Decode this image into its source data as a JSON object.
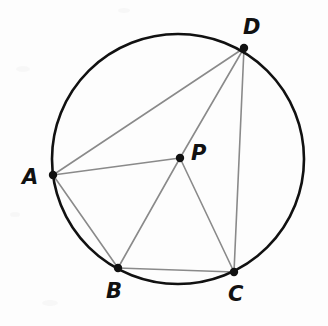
{
  "figure": {
    "background_color": "#fdfdfd",
    "circle_color": "#111111",
    "chord_color": "#8a8a8a",
    "point_color": "#111111",
    "label_color": "#111111"
  },
  "chart_data": {
    "type": "scatter",
    "xlabel": "",
    "ylabel": "",
    "grid": false,
    "legend": "none",
    "xlim": [
      0,
      328
    ],
    "ylim": [
      0,
      326
    ],
    "circle": {
      "center_x": 178,
      "center_y": 159,
      "radius": 126,
      "stroke_width": 2.6,
      "color": "#111111"
    },
    "points": [
      {
        "label": "A",
        "x": 53,
        "y": 175,
        "on_circle": true,
        "label_x": 22,
        "label_y": 167
      },
      {
        "label": "B",
        "x": 118,
        "y": 268,
        "on_circle": true,
        "label_x": 106,
        "label_y": 281
      },
      {
        "label": "C",
        "x": 234,
        "y": 272,
        "on_circle": true,
        "label_x": 228,
        "label_y": 284
      },
      {
        "label": "D",
        "x": 244,
        "y": 48,
        "on_circle": true,
        "label_x": 243,
        "label_y": 17
      },
      {
        "label": "P",
        "x": 180,
        "y": 158,
        "on_circle": false,
        "label_x": 191,
        "label_y": 143
      }
    ],
    "segments": [
      {
        "name": "A-D",
        "from": "A",
        "to": "D"
      },
      {
        "name": "A-P",
        "from": "A",
        "to": "P"
      },
      {
        "name": "A-B",
        "from": "A",
        "to": "B"
      },
      {
        "name": "D-P",
        "from": "D",
        "to": "P"
      },
      {
        "name": "D-C",
        "from": "D",
        "to": "C"
      },
      {
        "name": "P-B",
        "from": "P",
        "to": "B"
      },
      {
        "name": "P-C",
        "from": "P",
        "to": "C"
      },
      {
        "name": "B-C",
        "from": "B",
        "to": "C"
      }
    ]
  },
  "labels": {
    "A": "A",
    "B": "B",
    "C": "C",
    "D": "D",
    "P": "P"
  }
}
